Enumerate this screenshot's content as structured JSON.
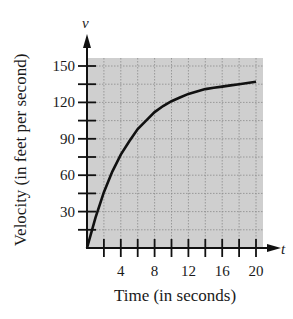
{
  "chart_data": {
    "type": "line",
    "title": "",
    "xlabel": "Time (in seconds)",
    "ylabel": "Velocity (in feet per second)",
    "x_axis_variable": "t",
    "y_axis_variable": "v",
    "x_ticks": [
      2,
      4,
      6,
      8,
      10,
      12,
      14,
      16,
      18,
      20
    ],
    "x_tick_labels": [
      "4",
      "8",
      "12",
      "16",
      "20"
    ],
    "y_ticks": [
      15,
      30,
      45,
      60,
      75,
      90,
      105,
      120,
      135,
      150
    ],
    "y_tick_labels": [
      "30",
      "60",
      "90",
      "120",
      "150"
    ],
    "xlim": [
      0,
      21
    ],
    "ylim": [
      0,
      157
    ],
    "grid": true,
    "background_color": "#cfcfcf",
    "series": [
      {
        "name": "v(t)",
        "x": [
          0,
          1,
          2,
          3,
          4,
          5,
          6,
          7,
          8,
          9,
          10,
          11,
          12,
          13,
          14,
          15,
          16,
          17,
          18,
          19,
          20
        ],
        "values": [
          0,
          25,
          46,
          63,
          77,
          88,
          98,
          105,
          112,
          117,
          121,
          124,
          127,
          129,
          131,
          132,
          133,
          134,
          135,
          136,
          137
        ]
      }
    ]
  }
}
